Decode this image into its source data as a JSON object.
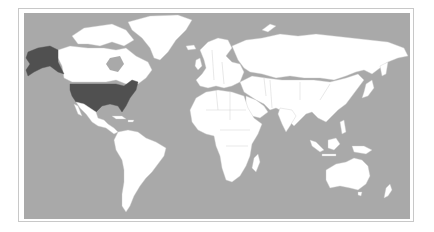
{
  "map": {
    "title": "",
    "projection": "equirectangular-like world map",
    "colors": {
      "ocean": "#a9a9a9",
      "land": "#ffffff",
      "highlight": "#505050",
      "frame": "#c8c8c8"
    },
    "highlighted_regions": [
      "United States",
      "Alaska"
    ]
  }
}
